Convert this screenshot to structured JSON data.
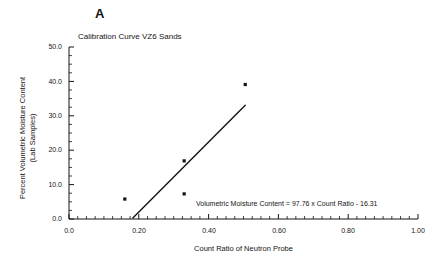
{
  "figure": {
    "panel_label": "A",
    "background_color": "#ffffff",
    "ink_color": "#141414"
  },
  "chart_data": {
    "type": "scatter",
    "title": "Calibration Curve VZ6 Sands",
    "xlabel": "Count Ratio of Neutron Probe",
    "ylabel": "Percent Volumetric Moisture Content (Lab Samples)",
    "ylabel_line1": "Percent Volumetric Moisture Content",
    "ylabel_line2": "(Lab Samples)",
    "xlim": [
      0.0,
      1.0
    ],
    "ylim": [
      0.0,
      50.0
    ],
    "grid": false,
    "legend": "none",
    "x_major_ticks": [
      0.0,
      0.2,
      0.4,
      0.6,
      0.8,
      1.0
    ],
    "x_tick_labels": [
      "0.0",
      "0.20",
      "0.40",
      "0.60",
      "0.80",
      "1.00"
    ],
    "x_minor_tick_step": 0.025,
    "y_major_ticks": [
      0.0,
      10.0,
      20.0,
      30.0,
      40.0,
      50.0
    ],
    "y_tick_labels": [
      "0.0",
      "10.0",
      "20.0",
      "30.0",
      "40.0",
      "50.0"
    ],
    "y_minor_tick_step": 2.5,
    "marker": "square",
    "marker_color": "#141414",
    "points": [
      {
        "x": 0.16,
        "y": 5.8
      },
      {
        "x": 0.33,
        "y": 7.3
      },
      {
        "x": 0.33,
        "y": 16.9
      },
      {
        "x": 0.505,
        "y": 39.1
      }
    ],
    "fit_line": {
      "slope": 97.76,
      "intercept": -16.31,
      "x_start": 0.183,
      "x_end": 0.505,
      "y_start": 0.3,
      "y_end": 33.1,
      "color": "#141414"
    },
    "annotations": [
      {
        "name": "regression-equation",
        "text": "Volumetric Moisture Content = 97.76 x Count Ratio - 16.31"
      }
    ]
  }
}
